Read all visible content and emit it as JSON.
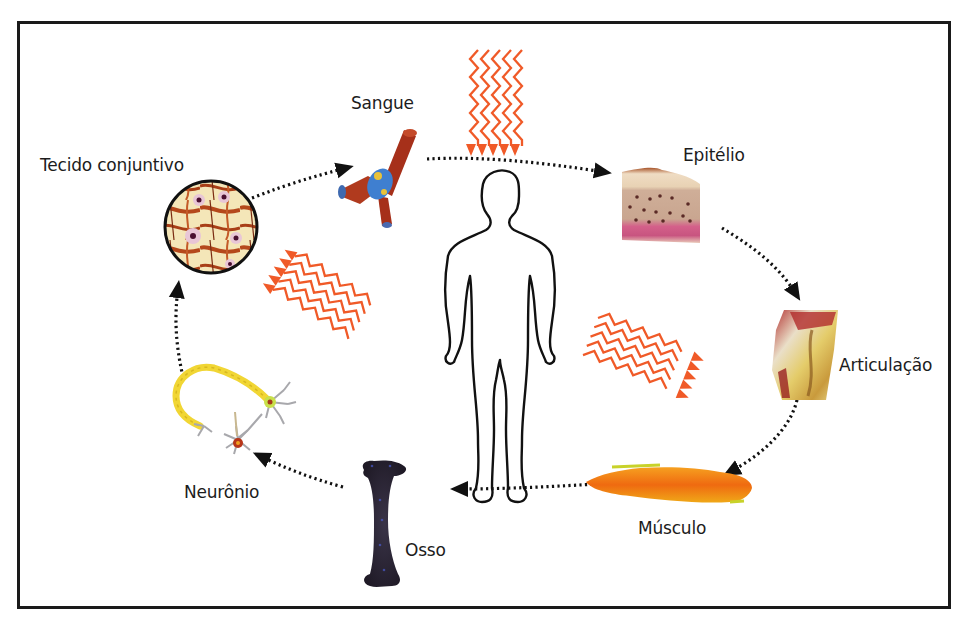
{
  "diagram": {
    "title": "",
    "center": {
      "name": "human-body",
      "description": "Contorno do corpo humano"
    },
    "nodes": [
      {
        "id": "sangue",
        "label": "Sangue"
      },
      {
        "id": "epitelio",
        "label": "Epitélio"
      },
      {
        "id": "articulacao",
        "label": "Articulação"
      },
      {
        "id": "musculo",
        "label": "Músculo"
      },
      {
        "id": "osso",
        "label": "Osso"
      },
      {
        "id": "neuronio",
        "label": "Neurônio"
      },
      {
        "id": "tecido_conjuntivo",
        "label": "Tecido conjuntivo"
      }
    ],
    "edges": [
      {
        "from": "sangue",
        "to": "epitelio",
        "style": "dotted-arrow"
      },
      {
        "from": "epitelio",
        "to": "articulacao",
        "style": "dotted-arrow"
      },
      {
        "from": "articulacao",
        "to": "musculo",
        "style": "dotted-arrow"
      },
      {
        "from": "musculo",
        "to": "osso",
        "style": "dotted-arrow"
      },
      {
        "from": "osso",
        "to": "neuronio",
        "style": "dotted-arrow"
      },
      {
        "from": "neuronio",
        "to": "tecido_conjuntivo",
        "style": "dotted-arrow"
      },
      {
        "from": "tecido_conjuntivo",
        "to": "sangue",
        "style": "dotted-arrow"
      }
    ],
    "radiation_arrows": [
      {
        "position": "top",
        "direction": "down",
        "count": 5
      },
      {
        "position": "left",
        "direction": "up-left",
        "count": 5
      },
      {
        "position": "right",
        "direction": "right",
        "count": 5
      }
    ],
    "colors": {
      "radiation": "#f05a28",
      "arrow": "#111111",
      "frame": "#1a1a1a"
    }
  }
}
